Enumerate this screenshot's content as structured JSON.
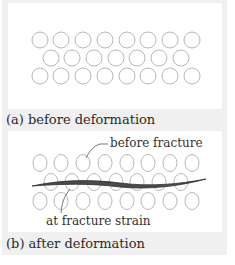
{
  "figure": {
    "panel_a": {
      "caption": "(a) before deformation",
      "rows": [
        {
          "y": 40,
          "x": [
            40,
            61,
            83,
            105,
            127,
            148,
            170,
            192
          ]
        },
        {
          "y": 58,
          "x": [
            51,
            72,
            94,
            116,
            137,
            159,
            181
          ]
        },
        {
          "y": 76,
          "x": [
            40,
            61,
            83,
            105,
            127,
            148,
            170,
            192
          ]
        }
      ]
    },
    "panel_b": {
      "caption": "(b) after deformation",
      "label_top": "before fracture",
      "label_bottom": "at fracture strain",
      "rows": [
        {
          "y": 163,
          "x": [
            40,
            61,
            83,
            105,
            127,
            148,
            170,
            192
          ]
        },
        {
          "y": 182,
          "x": [
            51,
            72,
            94,
            116,
            137,
            159,
            181
          ]
        },
        {
          "y": 201,
          "x": [
            40,
            61,
            83,
            105,
            127,
            148,
            170,
            192
          ]
        }
      ]
    },
    "colors": {
      "background": "#f0f0f0",
      "panel": "#ffffff",
      "circle_stroke": "#b8b8b8",
      "crack": "#3a3a3a",
      "text": "#2a2a2a"
    }
  }
}
